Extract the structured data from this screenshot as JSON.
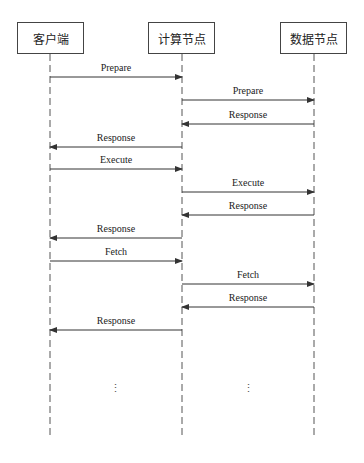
{
  "participants": [
    {
      "name": "客户端"
    },
    {
      "name": "计算节点"
    },
    {
      "name": "数据节点"
    }
  ],
  "messages": [
    {
      "label": "Prepare",
      "from": 0,
      "to": 1
    },
    {
      "label": "Prepare",
      "from": 1,
      "to": 2
    },
    {
      "label": "Response",
      "from": 2,
      "to": 1
    },
    {
      "label": "Response",
      "from": 1,
      "to": 0
    },
    {
      "label": "Execute",
      "from": 0,
      "to": 1
    },
    {
      "label": "Execute",
      "from": 1,
      "to": 2
    },
    {
      "label": "Response",
      "from": 2,
      "to": 1
    },
    {
      "label": "Response",
      "from": 1,
      "to": 0
    },
    {
      "label": "Fetch",
      "from": 0,
      "to": 1
    },
    {
      "label": "Fetch",
      "from": 1,
      "to": 2
    },
    {
      "label": "Response",
      "from": 2,
      "to": 1
    },
    {
      "label": "Response",
      "from": 1,
      "to": 0
    }
  ],
  "continuation": [
    "⋮",
    "⋮"
  ]
}
